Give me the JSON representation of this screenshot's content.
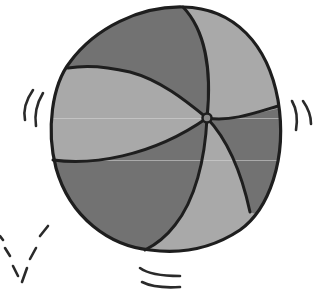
{
  "image": {
    "subject": "beach ball",
    "description": "Grayscale clip-art of a bouncing beach ball with alternating light and dark panels and motion lines",
    "colors": {
      "background": "#ffffff",
      "outline": "#1e1e1e",
      "panel_dark": "#727272",
      "panel_light": "#a9a9a9",
      "hub": "#8a8a8a",
      "artifact_line": "#d8d8d8"
    },
    "motion_lines": {
      "left": 2,
      "right": 2,
      "bottom": 2,
      "bottom_left_dashed_v": 1
    }
  }
}
